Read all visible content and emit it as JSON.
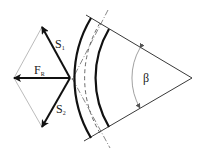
{
  "diagram": {
    "labels": {
      "s1": "S",
      "s1_sub": "1",
      "s2": "S",
      "s2_sub": "2",
      "fr": "F",
      "fr_sub": "R",
      "angle": "β"
    },
    "colors": {
      "stroke": "#111111",
      "construction": "#aaaaaa"
    }
  }
}
